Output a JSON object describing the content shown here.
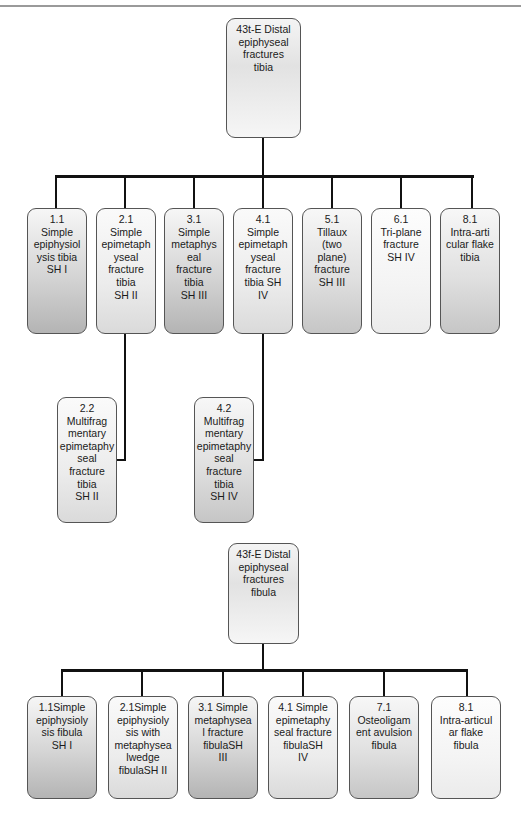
{
  "tibia": {
    "root": {
      "label": "43t-E Distal\nepiphyseal\nfractures\ntibia"
    },
    "children": [
      {
        "code": "1.1",
        "label": "1.1\nSimple\nepiphysiol\nysis tibia\nSH I"
      },
      {
        "code": "2.1",
        "label": "2.1\nSimple\nepimetaph\nyseal\nfracture\ntibia\nSH II"
      },
      {
        "code": "3.1",
        "label": "3.1\nSimple\nmetaphys\neal\nfracture\ntibia\nSH III"
      },
      {
        "code": "4.1",
        "label": "4.1\nSimple\nepimetaph\nyseal\nfracture\ntibia SH\nIV"
      },
      {
        "code": "5.1",
        "label": "5.1\nTillaux\n(two\nplane)\nfracture\nSH III"
      },
      {
        "code": "6.1",
        "label": "6.1\nTri-plane\nfracture\nSH IV"
      },
      {
        "code": "8.1",
        "label": "8.1\nIntra-arti\ncular flake\ntibia"
      }
    ],
    "subchildren": [
      {
        "code": "2.2",
        "parent": "2.1",
        "label": "2.2\nMultifrag\nmentary\nepimetaphy\nseal\nfracture\ntibia\nSH II"
      },
      {
        "code": "4.2",
        "parent": "4.1",
        "label": "4.2\nMultifrag\nmentary\nepimetaphy\nseal\nfracture\ntibia\nSH IV"
      }
    ]
  },
  "fibula": {
    "root": {
      "label": "43f-E Distal\nepiphyseal\nfractures\nfibula"
    },
    "children": [
      {
        "code": "1.1",
        "label": "1.1Simple\nepiphysioly\nsis fibula\nSH I"
      },
      {
        "code": "2.1",
        "label": "2.1Simple\nepiphysioly\nsis with\nmetaphysea\nlwedge\nfibulaSH II"
      },
      {
        "code": "3.1",
        "label": "3.1 Simple\nmetaphysea\nl fracture\nfibulaSH\nIII"
      },
      {
        "code": "4.1",
        "label": "4.1 Simple\nepimetaphy\nseal fracture\nfibulaSH\nIV"
      },
      {
        "code": "7.1",
        "label": "7.1\nOsteoligam\nent avulsion\nfibula"
      },
      {
        "code": "8.1",
        "label": "8.1\nIntra-articul\nar flake\nfibula"
      }
    ]
  }
}
